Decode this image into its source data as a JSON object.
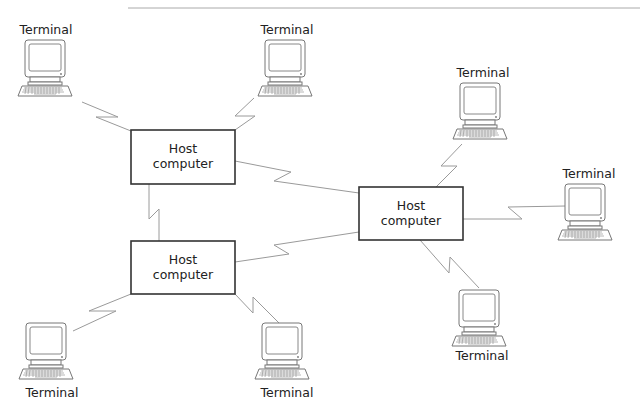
{
  "diagram": {
    "type": "network-topology",
    "hosts": [
      {
        "id": "host-1",
        "line1": "Host",
        "line2": "computer",
        "x": 131,
        "y": 130,
        "w": 104,
        "h": 54
      },
      {
        "id": "host-2",
        "line1": "Host",
        "line2": "computer",
        "x": 131,
        "y": 241,
        "w": 104,
        "h": 53
      },
      {
        "id": "host-3",
        "line1": "Host",
        "line2": "computer",
        "x": 359,
        "y": 187,
        "w": 104,
        "h": 53
      }
    ],
    "terminals": [
      {
        "id": "terminal-1",
        "label": "Terminal",
        "label_position": "above",
        "x": 18,
        "y": 38
      },
      {
        "id": "terminal-2",
        "label": "Terminal",
        "label_position": "above",
        "x": 256,
        "y": 38
      },
      {
        "id": "terminal-3",
        "label": "Terminal",
        "label_position": "above",
        "x": 451,
        "y": 82
      },
      {
        "id": "terminal-4",
        "label": "Terminal",
        "label_position": "above",
        "x": 557,
        "y": 182
      },
      {
        "id": "terminal-5",
        "label": "Terminal",
        "label_position": "below",
        "x": 451,
        "y": 290
      },
      {
        "id": "terminal-6",
        "label": "Terminal",
        "label_position": "below",
        "x": 19,
        "y": 323
      },
      {
        "id": "terminal-7",
        "label": "Terminal",
        "label_position": "below",
        "x": 255,
        "y": 323
      }
    ],
    "links": [
      {
        "from": "terminal-1",
        "to": "host-1"
      },
      {
        "from": "terminal-2",
        "to": "host-1"
      },
      {
        "from": "host-1",
        "to": "host-2"
      },
      {
        "from": "host-1",
        "to": "host-3"
      },
      {
        "from": "host-2",
        "to": "host-3"
      },
      {
        "from": "host-2",
        "to": "terminal-6"
      },
      {
        "from": "host-2",
        "to": "terminal-7"
      },
      {
        "from": "host-3",
        "to": "terminal-3"
      },
      {
        "from": "host-3",
        "to": "terminal-4"
      },
      {
        "from": "host-3",
        "to": "terminal-5"
      }
    ]
  }
}
